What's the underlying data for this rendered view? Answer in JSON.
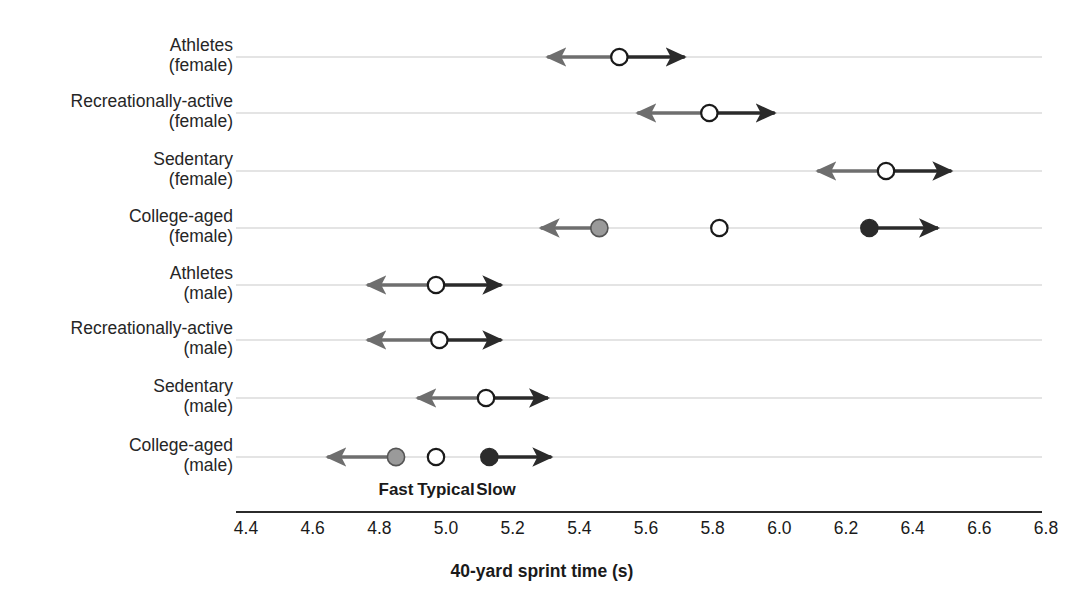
{
  "chart_data": {
    "type": "scatter",
    "title": "",
    "xlabel": "40-yard sprint time (s)",
    "ylabel": "",
    "xlim": [
      4.4,
      6.8
    ],
    "xticks": [
      "4.4",
      "4.6",
      "4.8",
      "5.0",
      "5.2",
      "5.4",
      "5.6",
      "5.8",
      "6.0",
      "6.2",
      "6.4",
      "6.6",
      "6.8"
    ],
    "grid": true,
    "legend": {
      "position": "inside-bottom",
      "entries": [
        {
          "label": "Fast",
          "marker": "filled-gray",
          "x": 4.85
        },
        {
          "label": "Typical",
          "marker": "open",
          "x": 5.0
        },
        {
          "label": "Slow",
          "marker": "filled-dark",
          "x": 5.15
        }
      ]
    },
    "categories": [
      "Athletes (female)",
      "Recreationally-active (female)",
      "Sedentary (female)",
      "College-aged (female)",
      "Athletes (male)",
      "Recreationally-active (male)",
      "Sedentary (male)",
      "College-aged (male)"
    ],
    "rows": [
      {
        "label_line1": "Athletes",
        "label_line2": "(female)",
        "typical": 5.52,
        "range_low": 5.28,
        "range_high": 5.74,
        "markers": [
          {
            "type": "open",
            "x": 5.52
          }
        ],
        "arrows": [
          {
            "dir": "left",
            "from": 5.52,
            "to": 5.28
          },
          {
            "dir": "right",
            "from": 5.52,
            "to": 5.74
          }
        ]
      },
      {
        "label_line1": "Recreationally-active",
        "label_line2": "(female)",
        "typical": 5.79,
        "range_low": 5.55,
        "range_high": 6.01,
        "markers": [
          {
            "type": "open",
            "x": 5.79
          }
        ],
        "arrows": [
          {
            "dir": "left",
            "from": 5.79,
            "to": 5.55
          },
          {
            "dir": "right",
            "from": 5.79,
            "to": 6.01
          }
        ]
      },
      {
        "label_line1": "Sedentary",
        "label_line2": "(female)",
        "typical": 6.32,
        "range_low": 6.09,
        "range_high": 6.54,
        "markers": [
          {
            "type": "open",
            "x": 6.32
          }
        ],
        "arrows": [
          {
            "dir": "left",
            "from": 6.32,
            "to": 6.09
          },
          {
            "dir": "right",
            "from": 6.32,
            "to": 6.54
          }
        ]
      },
      {
        "label_line1": "College-aged",
        "label_line2": "(female)",
        "typical": 5.82,
        "range_low": 5.26,
        "range_high": 6.5,
        "markers": [
          {
            "type": "filled-gray",
            "x": 5.46
          },
          {
            "type": "open",
            "x": 5.82
          },
          {
            "type": "filled-dark",
            "x": 6.27
          }
        ],
        "arrows": [
          {
            "dir": "left",
            "from": 5.46,
            "to": 5.26
          },
          {
            "dir": "right",
            "from": 6.27,
            "to": 6.5
          }
        ]
      },
      {
        "label_line1": "Athletes",
        "label_line2": "(male)",
        "typical": 4.97,
        "range_low": 4.74,
        "range_high": 5.19,
        "markers": [
          {
            "type": "open",
            "x": 4.97
          }
        ],
        "arrows": [
          {
            "dir": "left",
            "from": 4.97,
            "to": 4.74
          },
          {
            "dir": "right",
            "from": 4.97,
            "to": 5.19
          }
        ]
      },
      {
        "label_line1": "Recreationally-active",
        "label_line2": "(male)",
        "typical": 4.98,
        "range_low": 4.74,
        "range_high": 5.19,
        "markers": [
          {
            "type": "open",
            "x": 4.98
          }
        ],
        "arrows": [
          {
            "dir": "left",
            "from": 4.98,
            "to": 4.74
          },
          {
            "dir": "right",
            "from": 4.98,
            "to": 5.19
          }
        ]
      },
      {
        "label_line1": "Sedentary",
        "label_line2": "(male)",
        "typical": 5.12,
        "range_low": 4.89,
        "range_high": 5.33,
        "markers": [
          {
            "type": "open",
            "x": 5.12
          }
        ],
        "arrows": [
          {
            "dir": "left",
            "from": 5.12,
            "to": 4.89
          },
          {
            "dir": "right",
            "from": 5.12,
            "to": 5.33
          }
        ]
      },
      {
        "label_line1": "College-aged",
        "label_line2": "(male)",
        "typical": 4.97,
        "range_low": 4.62,
        "range_high": 5.34,
        "markers": [
          {
            "type": "filled-gray",
            "x": 4.85
          },
          {
            "type": "open",
            "x": 4.97
          },
          {
            "type": "filled-dark",
            "x": 5.13
          }
        ],
        "arrows": [
          {
            "dir": "left",
            "from": 4.85,
            "to": 4.62
          },
          {
            "dir": "right",
            "from": 5.13,
            "to": 5.34
          }
        ]
      }
    ]
  },
  "colors": {
    "arrow": "#2b2b2b",
    "arrow_light": "#6e6e6e",
    "gridline": "#c9c9c9",
    "axis": "#2b2b2b",
    "marker_open_fill": "#ffffff",
    "marker_open_stroke": "#1a1a1a",
    "marker_gray": "#9a9a9a",
    "marker_dark": "#2b2b2b",
    "text": "#1a1a1a"
  },
  "layout": {
    "x_at_4_4": 246,
    "px_per_tick": 66.67,
    "row_ys": [
      57,
      113,
      171,
      228,
      285,
      340,
      398,
      457
    ],
    "grid_left": 236,
    "grid_right": 1042,
    "axis_y": 512,
    "tick_label_y": 518,
    "legend_y": 480
  }
}
